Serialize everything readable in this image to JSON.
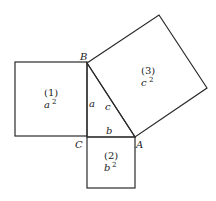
{
  "diagram": {
    "vertices": {
      "A": "A",
      "B": "B",
      "C": "C"
    },
    "sides": {
      "a": "a",
      "b": "b",
      "c": "c"
    },
    "squares": [
      {
        "id": "(1)",
        "var": "a",
        "exp": "2"
      },
      {
        "id": "(2)",
        "var": "b",
        "exp": "2"
      },
      {
        "id": "(3)",
        "var": "c",
        "exp": "2"
      }
    ],
    "stroke_color": "#2a2a2a"
  }
}
